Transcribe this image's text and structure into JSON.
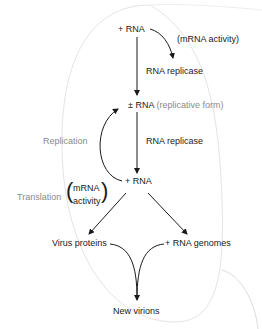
{
  "diagram": {
    "nodes": {
      "plus_rna_top": "+ RNA",
      "pm_rna_prefix": "± RNA",
      "pm_rna_suffix": "(replicative form)",
      "plus_rna_mid": "+ RNA",
      "virus_proteins": "Virus proteins",
      "rna_genomes": "+ RNA genomes",
      "new_virions": "New virions"
    },
    "edge_labels": {
      "mrna_activity_top": "(mRNA activity)",
      "rna_replicase_1": "RNA replicase",
      "rna_replicase_2": "RNA replicase",
      "replication": "Replication",
      "translation": "Translation",
      "mrna_activity_line1": "mRNA",
      "mrna_activity_line2": "activity"
    },
    "colors": {
      "arrow": "#1a1a1a",
      "annotation_grey": "#8a8a8a",
      "outline": "#e2e2e2"
    }
  }
}
